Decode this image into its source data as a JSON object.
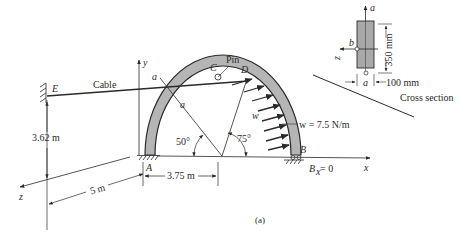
{
  "figure": {
    "caption": "(a)",
    "points": {
      "A": "A",
      "B": "B",
      "C": "C",
      "D": "D",
      "E": "E"
    },
    "labels": {
      "cable": "Cable",
      "pin": "Pin",
      "section_a_top": "a",
      "section_a_mid": "a",
      "load_symbol": "w",
      "load_value": "w = 7.5 N/m",
      "support_B": "B",
      "bx": "B",
      "bx_sub": "x",
      "bx_eq": " = 0"
    },
    "axes": {
      "x": "x",
      "y": "y",
      "z": "z"
    },
    "dimensions": {
      "height_E": "3.62 m",
      "dist_z": "5 m",
      "dist_x": "3.75 m"
    },
    "angles": {
      "a1": "50°",
      "a2": "75°"
    },
    "cross_section": {
      "title": "Cross section",
      "height": "350 mm",
      "width": "100 mm",
      "axis_a_top": "a",
      "axis_a_bottom": "a",
      "axis_b": "b",
      "axis_z": "z"
    },
    "colors": {
      "ink": "#2a2a2a",
      "arch_fill": "#b5b5b5",
      "section_fill": "#a9a9a9"
    }
  }
}
